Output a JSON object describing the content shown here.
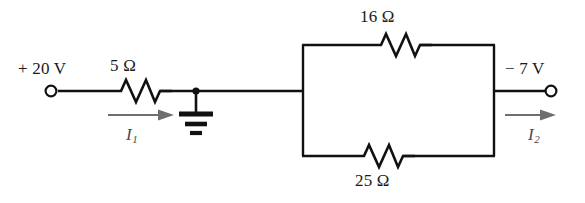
{
  "figure": {
    "colors": {
      "wire": "#111111",
      "background": "#ffffff",
      "current_arrow": "#6e6e6e",
      "text": "#1a1a1a"
    }
  },
  "terminals": {
    "left": {
      "label": "+ 20 V",
      "name": "left-terminal",
      "x": 50,
      "y": 91
    },
    "right": {
      "label": "− 7 V",
      "name": "right-terminal",
      "x": 551,
      "y": 91
    }
  },
  "components": {
    "series_resistor": {
      "label": "5 Ω",
      "value": 5,
      "unit": "Ω",
      "x": 135,
      "y": 91
    },
    "top_resistor": {
      "label": "16 Ω",
      "value": 16,
      "unit": "Ω",
      "x": 395,
      "y": 45
    },
    "bottom_resistor": {
      "label": "25 Ω",
      "value": 25,
      "unit": "Ω",
      "x": 378,
      "y": 156
    },
    "ground": {
      "label": "ground-symbol",
      "x": 196,
      "y": 91
    }
  },
  "currents": {
    "i1": {
      "symbol": "I",
      "subscript": "1",
      "direction": "right"
    },
    "i2": {
      "symbol": "I",
      "subscript": "2",
      "direction": "right"
    }
  }
}
